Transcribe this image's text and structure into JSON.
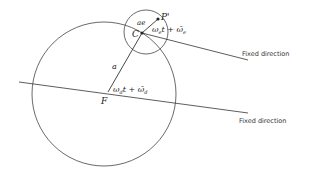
{
  "diagram": {
    "labels": {
      "P_prime": "P'",
      "C": "C",
      "F": "F",
      "a": "a",
      "ae": "ae",
      "angle_e": "ω",
      "angle_e_sub": "e",
      "angle_e_rest": "t + ",
      "angle_e_bar": "ω̄",
      "angle_e_bar_sub": "e",
      "angle_d": "ω",
      "angle_d_sub": "d",
      "angle_d_rest": "t + ",
      "angle_d_bar": "ω̄",
      "angle_d_bar_sub": "d"
    },
    "fixed_direction_upper": "Fixed direction",
    "fixed_direction_lower": "Fixed direction",
    "colors": {
      "line": "#333333",
      "text": "#222222"
    }
  }
}
